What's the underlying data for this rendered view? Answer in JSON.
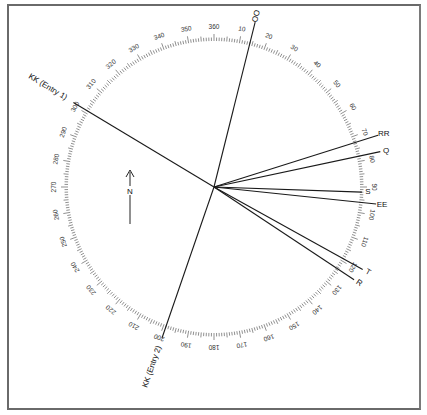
{
  "diagram": {
    "type": "compass-rose-bearing-diagram",
    "center": {
      "x": 214,
      "y": 187
    },
    "radius": 146,
    "north_label": "N",
    "scale": {
      "start": 10,
      "end": 360,
      "step_labels": 10,
      "labels": [
        "10",
        "20",
        "30",
        "40",
        "50",
        "60",
        "70",
        "80",
        "90",
        "100",
        "110",
        "120",
        "130",
        "140",
        "150",
        "160",
        "170",
        "180",
        "190",
        "200",
        "210",
        "220",
        "230",
        "240",
        "250",
        "260",
        "270",
        "280",
        "290",
        "300",
        "310",
        "320",
        "330",
        "340",
        "350",
        "360"
      ]
    },
    "bearings": [
      {
        "id": "OO",
        "label": "OO",
        "bearing": 14,
        "length": 170
      },
      {
        "id": "RR",
        "label": "RR",
        "bearing": 72.5,
        "length": 172
      },
      {
        "id": "Q",
        "label": "Q",
        "bearing": 78,
        "length": 170
      },
      {
        "id": "S",
        "label": "S",
        "bearing": 92,
        "length": 148
      },
      {
        "id": "EE",
        "label": "EE",
        "bearing": 96,
        "length": 163
      },
      {
        "id": "T",
        "label": "T",
        "bearing": 119,
        "length": 170
      },
      {
        "id": "R",
        "label": "R",
        "bearing": 123.5,
        "length": 168
      },
      {
        "id": "KK1",
        "label": "KK (Entry 1)",
        "bearing": 301,
        "length": 164
      },
      {
        "id": "KK2",
        "label": "KK (Entry 2)",
        "bearing": 199,
        "length": 160
      }
    ]
  }
}
